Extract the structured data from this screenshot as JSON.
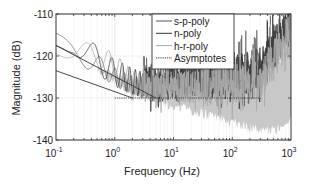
{
  "chart_data": {
    "type": "line",
    "title": "",
    "xlabel": "Frequency (Hz)",
    "ylabel": "Magnitude (dB)",
    "xscale": "log",
    "xlim": [
      0.1,
      1000
    ],
    "ylim": [
      -140,
      -110
    ],
    "grid": true,
    "xticks": [
      0.1,
      1,
      10,
      100,
      1000
    ],
    "xtick_labels": [
      {
        "base": "10",
        "exp": "-1"
      },
      {
        "base": "10",
        "exp": "0"
      },
      {
        "base": "10",
        "exp": "1"
      },
      {
        "base": "10",
        "exp": "2"
      },
      {
        "base": "10",
        "exp": "3"
      }
    ],
    "yticks": [
      -110,
      -120,
      -130,
      -140
    ],
    "ytick_labels": [
      "-110",
      "-120",
      "-130",
      "-140"
    ],
    "legend": {
      "position": "upper-right-inside",
      "entries": [
        {
          "label": "s-p-poly",
          "style": "solid",
          "color": "#555555"
        },
        {
          "label": "n-poly",
          "style": "solid",
          "color": "#333333"
        },
        {
          "label": "h-r-poly",
          "style": "solid",
          "color": "#aaaaaa"
        },
        {
          "label": "Asymptotes",
          "style": "dotted",
          "color": "#333333"
        }
      ]
    },
    "series": [
      {
        "name": "s-p-poly",
        "description": "oscillating noise spectrum decreasing from ~-118 dB at 0.1 Hz to ~-130 dB noise floor, rising to ~-113 dB at 1 kHz",
        "x": [
          0.1,
          0.2,
          0.5,
          1,
          2,
          5,
          10,
          50,
          100,
          300,
          1000
        ],
        "y": [
          -117,
          -119,
          -122,
          -125,
          -127,
          -127,
          -126,
          -126,
          -125.5,
          -124,
          -113
        ]
      },
      {
        "name": "n-poly",
        "description": "oscillating trace with large swings around upper asymptote at low freq, dense noise band at high freq",
        "x": [
          0.1,
          0.2,
          0.5,
          1,
          2,
          5,
          10,
          50,
          100,
          300,
          1000
        ],
        "y": [
          -118,
          -116,
          -121,
          -124,
          -126,
          -128,
          -127,
          -126,
          -126,
          -124,
          -114
        ]
      },
      {
        "name": "h-r-poly",
        "description": "light gray trace, broad noise band filling ~-126 to ~-139 dB above 5 Hz",
        "x": [
          0.1,
          0.2,
          0.5,
          1,
          2,
          5,
          10,
          50,
          100,
          300,
          1000
        ],
        "y": [
          -116.5,
          -119,
          -120,
          -122,
          -126,
          -128,
          -128,
          -128,
          -128,
          -127,
          -115
        ]
      },
      {
        "name": "Asymptotes",
        "segments": [
          {
            "x": [
              0.1,
              5
            ],
            "y": [
              -117.5,
              -130
            ]
          },
          {
            "x": [
              0.1,
              2
            ],
            "y": [
              -123.5,
              -130
            ]
          },
          {
            "x": [
              1,
              300
            ],
            "y": [
              -130,
              -130
            ]
          }
        ]
      }
    ]
  }
}
